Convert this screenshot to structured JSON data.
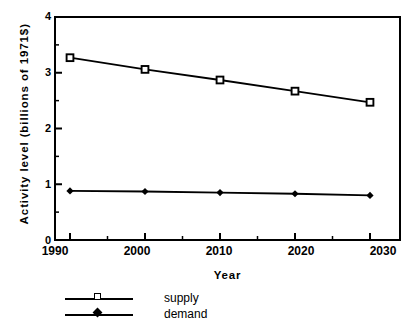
{
  "chart_data": {
    "type": "line",
    "title": "",
    "xlabel": "Year",
    "ylabel": "Activity level (billions of 1971$)",
    "x": [
      1990,
      2000,
      2010,
      2020,
      2030
    ],
    "xtick_labels": [
      "1990",
      "2000",
      "2010",
      "2020",
      "2030"
    ],
    "ytick_labels": [
      "0",
      "1",
      "2",
      "3",
      "4"
    ],
    "ytick_values": [
      0,
      1,
      2,
      3,
      4
    ],
    "xlim": [
      1988,
      2034
    ],
    "ylim": [
      0,
      4
    ],
    "grid": false,
    "legend_position": "below-left",
    "minor_ticks_y": [
      0.5,
      1.5,
      2.5,
      3.5
    ],
    "minor_ticks_x": [
      1995,
      2005,
      2015,
      2025
    ],
    "series": [
      {
        "name": "supply",
        "marker": "open-square",
        "values": [
          3.27,
          3.06,
          2.87,
          2.67,
          2.47
        ]
      },
      {
        "name": "demand",
        "marker": "filled-diamond",
        "values": [
          0.88,
          0.87,
          0.85,
          0.83,
          0.8
        ]
      }
    ]
  },
  "legend": {
    "items": [
      {
        "label": "supply"
      },
      {
        "label": "demand"
      }
    ]
  },
  "colors": {
    "axis": "#000000",
    "line": "#000000",
    "background": "#ffffff"
  }
}
